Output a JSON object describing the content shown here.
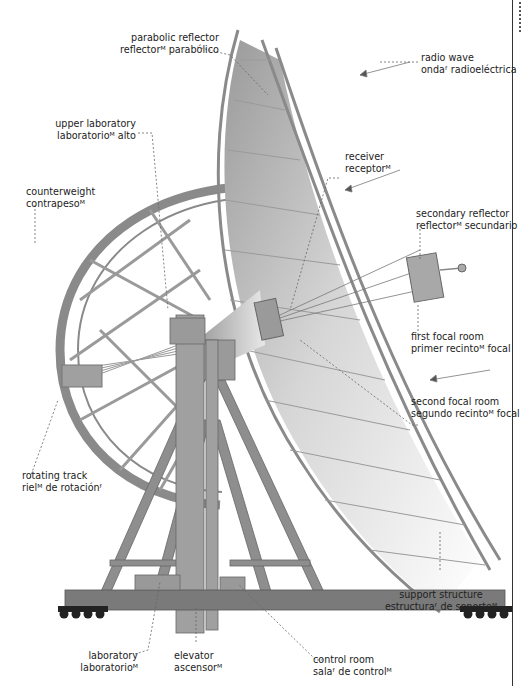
{
  "colors": {
    "structure": "#8a8a8a",
    "structure_dark": "#6b6b6b",
    "base": "#7a7a7a",
    "wheels": "#222222",
    "leader": "#666666",
    "text": "#222222"
  },
  "labels": {
    "parabolic_reflector": {
      "en": "parabolic reflector",
      "es": "reflectorᴹ parabólico"
    },
    "radio_wave": {
      "en": "radio wave",
      "es": "ondaᶠ radioeléctrica"
    },
    "upper_laboratory": {
      "en": "upper laboratory",
      "es": "laboratorioᴹ alto"
    },
    "receiver": {
      "en": "receiver",
      "es": "receptorᴹ"
    },
    "counterweight": {
      "en": "counterweight",
      "es": "contrapesoᴹ"
    },
    "secondary_reflector": {
      "en": "secondary reflector",
      "es": "reflectorᴹ secundario"
    },
    "first_focal_room": {
      "en": "first focal room",
      "es": "primer recintoᴹ focal"
    },
    "second_focal_room": {
      "en": "second focal room",
      "es": "segundo recintoᴹ focal"
    },
    "rotating_track": {
      "en": "rotating track",
      "es": "rielᴹ de rotaciónᶠ"
    },
    "support_structure": {
      "en": "support structure",
      "es": "estructuraᶠ de soporteᴹ"
    },
    "laboratory": {
      "en": "laboratory",
      "es": "laboratorioᴹ"
    },
    "elevator": {
      "en": "elevator",
      "es": "ascensorᴹ"
    },
    "control_room": {
      "en": "control room",
      "es": "salaᶠ de controlᴹ"
    }
  }
}
